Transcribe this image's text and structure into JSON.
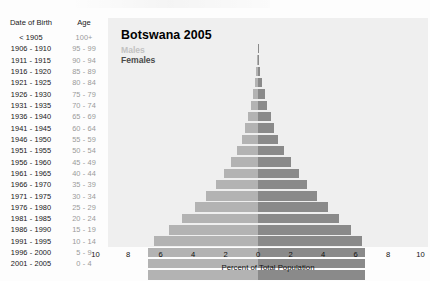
{
  "table_headers": {
    "date_of_birth": "Date of Birth",
    "age": "Age"
  },
  "chart_data": {
    "type": "bar",
    "subtype": "population-pyramid",
    "title": "Botswana 2005",
    "xlabel": "Percent of Total Population",
    "ylabel": "",
    "xlim": [
      -10,
      10
    ],
    "xticks": [
      "10",
      "8",
      "6",
      "4",
      "2",
      "0",
      "2",
      "4",
      "6",
      "8",
      "10"
    ],
    "xtick_values": [
      -10,
      -8,
      -6,
      -4,
      -2,
      0,
      2,
      4,
      6,
      8,
      10
    ],
    "grid": false,
    "legend": [
      "Males",
      "Females"
    ],
    "legend_position": "top-left",
    "colors": {
      "males": "#b3b3b3",
      "females": "#8a8a8a",
      "panel": "#efefef"
    },
    "categories": [
      "100+",
      "95 - 99",
      "90 - 94",
      "85 - 89",
      "80 - 84",
      "75 - 79",
      "70 - 74",
      "65 - 69",
      "60 - 64",
      "55 - 59",
      "50 - 54",
      "45 - 49",
      "40 - 44",
      "35 - 39",
      "30 - 34",
      "25 - 29",
      "20 - 24",
      "15 - 19",
      "10 - 14",
      "5 - 9",
      "0 - 4"
    ],
    "date_of_birth": [
      "< 1905",
      "1906 - 1910",
      "1911 - 1915",
      "1916 - 1920",
      "1921 - 1925",
      "1926 - 1930",
      "1931 - 1935",
      "1936 - 1940",
      "1941 - 1945",
      "1946 - 1950",
      "1951 - 1955",
      "1956 - 1960",
      "1961 - 1965",
      "1966 - 1970",
      "1971 - 1975",
      "1976 - 1980",
      "1981 - 1985",
      "1986 - 1990",
      "1991 - 1995",
      "1996 - 2000",
      "2001 - 2005"
    ],
    "series": [
      {
        "name": "Males",
        "values": [
          0.03,
          0.06,
          0.1,
          0.18,
          0.3,
          0.45,
          0.62,
          0.8,
          1.0,
          1.3,
          1.65,
          2.1,
          2.6,
          3.2,
          3.9,
          4.7,
          5.5,
          6.4,
          6.8,
          6.8,
          6.8
        ]
      },
      {
        "name": "Females",
        "values": [
          0.04,
          0.08,
          0.14,
          0.24,
          0.4,
          0.58,
          0.78,
          1.0,
          1.25,
          1.6,
          2.0,
          2.5,
          3.0,
          3.6,
          4.3,
          5.0,
          5.7,
          6.4,
          6.6,
          6.6,
          6.6
        ]
      }
    ]
  }
}
